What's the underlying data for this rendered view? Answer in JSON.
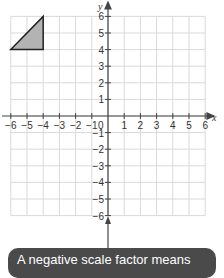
{
  "graph": {
    "x_axis_label": "x",
    "y_axis_label": "y",
    "x_ticks": [
      "−6",
      "−5",
      "−4",
      "−3",
      "−2",
      "−1",
      "1",
      "2",
      "3",
      "4",
      "5",
      "6"
    ],
    "y_ticks": [
      "6",
      "5",
      "4",
      "3",
      "2",
      "1",
      "−1",
      "−2",
      "−3",
      "−4",
      "−5",
      "−6"
    ],
    "origin_label": "0",
    "shape": {
      "type": "triangle",
      "vertices": [
        [
          -6,
          4
        ],
        [
          -4,
          4
        ],
        [
          -4,
          6
        ]
      ],
      "fill": "#b3b3b3",
      "stroke": "#222222"
    },
    "grid_color": "#d9d9d9",
    "axis_color": "#444444"
  },
  "tooltip": {
    "text": "A negative scale factor means",
    "background": "#4a4a4a"
  }
}
